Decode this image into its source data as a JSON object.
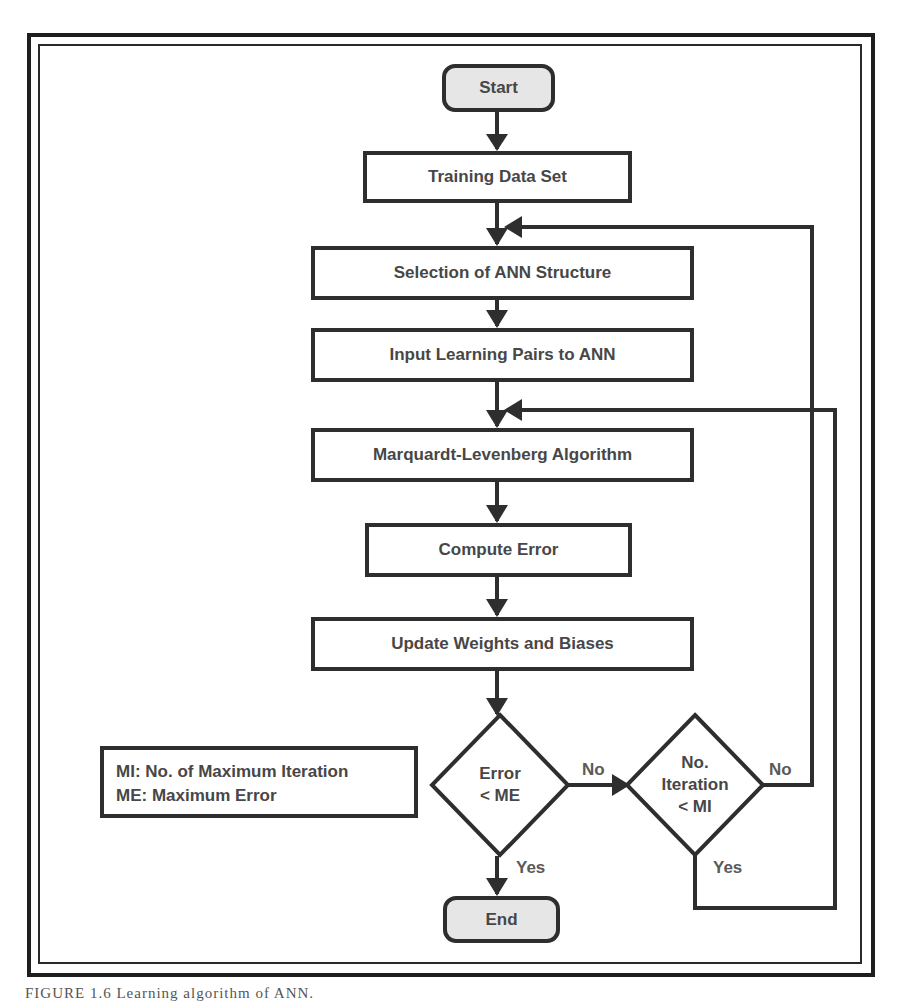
{
  "diagram": {
    "nodes": {
      "start": "Start",
      "training_data": "Training Data Set",
      "selection": "Selection of ANN Structure",
      "input_pairs": "Input Learning Pairs to ANN",
      "algorithm": "Marquardt-Levenberg Algorithm",
      "compute_error": "Compute Error",
      "update_weights": "Update Weights and Biases",
      "end": "End"
    },
    "decisions": {
      "error_check": {
        "line1": "Error",
        "line2": "< ME"
      },
      "iteration_check": {
        "line1": "No.",
        "line2": "Iteration",
        "line3": "< MI"
      }
    },
    "edge_labels": {
      "error_no": "No",
      "error_yes": "Yes",
      "iteration_no": "No",
      "iteration_yes": "Yes"
    },
    "legend": {
      "mi": "MI: No. of Maximum Iteration",
      "me": "ME: Maximum Error"
    },
    "caption": "FIGURE 1.6   Learning algorithm of ANN."
  },
  "colors": {
    "stroke": "#2e2e2e",
    "text": "#474747",
    "terminal_fill": "#e6e6e6",
    "frame": "#1e1e1e"
  }
}
